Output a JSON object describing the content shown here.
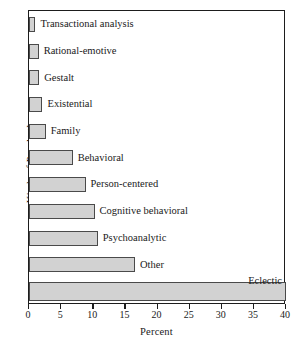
{
  "chart_data": {
    "type": "bar",
    "orientation": "horizontal",
    "title": "",
    "xlabel": "Percent",
    "ylabel": "Kinds of Psychotherapy",
    "xlim": [
      0,
      40
    ],
    "xticks": [
      0,
      5,
      10,
      15,
      20,
      25,
      30,
      35,
      40
    ],
    "xtick_labels": [
      "0",
      "5",
      "10",
      "15",
      "20",
      "25",
      "30",
      "35",
      "40"
    ],
    "grid": false,
    "legend": null,
    "categories": [
      "Transactional analysis",
      "Rational-emotive",
      "Gestalt",
      "Existential",
      "Family",
      "Behavioral",
      "Person-centered",
      "Cognitive behavioral",
      "Psychoanalytic",
      "Other",
      "Eclectic"
    ],
    "values": [
      1,
      1.5,
      1.6,
      2.1,
      2.6,
      6.8,
      8.8,
      10.2,
      10.7,
      16.5,
      40
    ],
    "bar_fill_color": "#d2d2d2",
    "bar_edge_color": "#4a4a4a",
    "frame_color": "#1d1d1d",
    "background_color": "#ffffff"
  },
  "axes": {
    "x_title": "Percent",
    "y_title": "Kinds of Psychotherapy"
  },
  "bars": [
    {
      "label": "Transactional analysis",
      "value": 1,
      "label_position": "right"
    },
    {
      "label": "Rational-emotive",
      "value": 1.5,
      "label_position": "right"
    },
    {
      "label": "Gestalt",
      "value": 1.6,
      "label_position": "right"
    },
    {
      "label": "Existential",
      "value": 2.1,
      "label_position": "right"
    },
    {
      "label": "Family",
      "value": 2.6,
      "label_position": "right"
    },
    {
      "label": "Behavioral",
      "value": 6.8,
      "label_position": "right"
    },
    {
      "label": "Person-centered",
      "value": 8.8,
      "label_position": "right"
    },
    {
      "label": "Cognitive behavioral",
      "value": 10.2,
      "label_position": "right"
    },
    {
      "label": "Psychoanalytic",
      "value": 10.7,
      "label_position": "right"
    },
    {
      "label": "Other",
      "value": 16.5,
      "label_position": "right"
    },
    {
      "label": "Eclectic",
      "value": 40,
      "label_position": "above-right"
    }
  ],
  "ticks": [
    {
      "value": 0,
      "label": "0"
    },
    {
      "value": 5,
      "label": "5"
    },
    {
      "value": 10,
      "label": "10"
    },
    {
      "value": 15,
      "label": "15"
    },
    {
      "value": 20,
      "label": "20"
    },
    {
      "value": 25,
      "label": "25"
    },
    {
      "value": 30,
      "label": "30"
    },
    {
      "value": 35,
      "label": "35"
    },
    {
      "value": 40,
      "label": "40"
    }
  ]
}
